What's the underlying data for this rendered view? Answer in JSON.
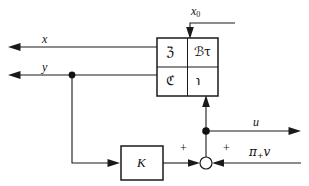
{
  "figure": {
    "type": "block-diagram",
    "background_color": "#ffffff",
    "line_color": "#1a1a1a"
  },
  "system_block": {
    "name": "partitioned-operator-block",
    "cells": [
      {
        "id": "cell-A",
        "label": "ℨ",
        "position": "top-left"
      },
      {
        "id": "cell-Btau",
        "label": "ℬτ",
        "position": "top-right"
      },
      {
        "id": "cell-C",
        "label": "ℭ",
        "position": "bottom-left"
      },
      {
        "id": "cell-D",
        "label": "℩",
        "position": "bottom-right"
      }
    ]
  },
  "gain_block": {
    "name": "feedback-gain-block",
    "label": "K"
  },
  "summing_junction": {
    "name": "summing-junction",
    "left_sign": "+",
    "right_sign": "+"
  },
  "signals": {
    "initial_state": "x",
    "initial_state_sub": "0",
    "state_output": "x",
    "measured_output": "y",
    "control_output": "u",
    "exogenous_input_pi": "π",
    "exogenous_input_sub": "+",
    "exogenous_input_v": "v"
  }
}
